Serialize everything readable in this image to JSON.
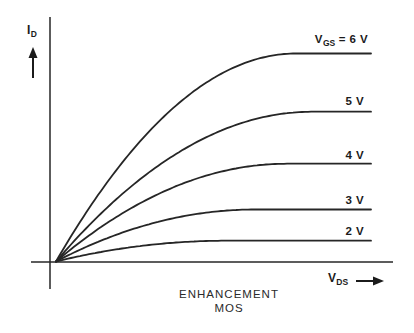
{
  "figure": {
    "background_color": "#ffffff",
    "ink_color": "#262626",
    "caption_line1": "ENHANCEMENT",
    "caption_line2": "MOS",
    "y_axis_symbol": "I",
    "y_axis_subscript": "D",
    "x_axis_symbol": "V",
    "x_axis_subscript": "DS"
  },
  "chart_data": {
    "type": "line",
    "title": "",
    "subtitle": "",
    "xlabel": "V_DS (drain-source voltage, unlabeled arbitrary units)",
    "ylabel": "I_D (drain current, unlabeled arbitrary units)",
    "axis_ticks": "none (qualitative textbook sketch)",
    "grid": false,
    "legend_position": "labels at right end of each curve",
    "x_range": [
      0,
      1
    ],
    "y_range": [
      0,
      1
    ],
    "annotations": [
      "ENHANCEMENT",
      "MOS"
    ],
    "series": [
      {
        "name": "VGS = 6 V",
        "vgs_volts": 6,
        "saturation_level": 1.0,
        "knee_x": 0.76,
        "label_parts": {
          "prefix": "V",
          "sub": "GS",
          "rest": " = 6 V"
        }
      },
      {
        "name": "VGS = 5 V",
        "vgs_volts": 5,
        "saturation_level": 0.72,
        "knee_x": 0.81,
        "label": "5 V"
      },
      {
        "name": "VGS = 4 V",
        "vgs_volts": 4,
        "saturation_level": 0.47,
        "knee_x": 0.73,
        "label": "4 V"
      },
      {
        "name": "VGS = 3 V",
        "vgs_volts": 3,
        "saturation_level": 0.25,
        "knee_x": 0.63,
        "label": "3 V"
      },
      {
        "name": "VGS = 2 V",
        "vgs_volts": 2,
        "saturation_level": 0.1,
        "knee_x": 0.54,
        "label": "2 V"
      }
    ],
    "curve_model": "y = sat * (2u - u^2), u = min(x / knee_x, 1); all curves start at the origin"
  }
}
